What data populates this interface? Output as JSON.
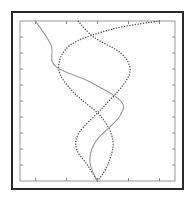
{
  "chart_data": {
    "type": "line",
    "title": "",
    "xlabel": "",
    "ylabel": "",
    "xlim": [
      -1,
      1
    ],
    "ylim": [
      0,
      1
    ],
    "grid": false,
    "legend": "none",
    "x_ticks": [
      -0.8,
      -0.4,
      0.0,
      0.4,
      0.8
    ],
    "y_ticks": [
      0.1,
      0.2,
      0.3,
      0.4,
      0.5,
      0.6,
      0.7,
      0.8,
      0.9
    ],
    "tick_labels_visible": false,
    "series": [
      {
        "name": "curve-1",
        "style": "dotted",
        "color": "#555555",
        "points": [
          [
            0.0,
            0.0
          ],
          [
            -0.13,
            0.1
          ],
          [
            -0.27,
            0.2
          ],
          [
            -0.24,
            0.3
          ],
          [
            0.05,
            0.45
          ],
          [
            0.33,
            0.6
          ],
          [
            0.42,
            0.7
          ],
          [
            0.3,
            0.8
          ],
          [
            -0.05,
            0.9
          ],
          [
            -0.25,
            1.0
          ]
        ]
      },
      {
        "name": "curve-2",
        "style": "dotted",
        "color": "#555555",
        "points": [
          [
            0.0,
            0.0
          ],
          [
            0.13,
            0.1
          ],
          [
            0.2,
            0.25
          ],
          [
            0.05,
            0.4
          ],
          [
            -0.3,
            0.55
          ],
          [
            -0.5,
            0.7
          ],
          [
            -0.35,
            0.85
          ],
          [
            0.2,
            0.95
          ],
          [
            0.8,
            1.0
          ]
        ]
      },
      {
        "name": "curve-3",
        "style": "solid-light",
        "color": "#9a9a9a",
        "points": [
          [
            0.0,
            0.0
          ],
          [
            -0.1,
            0.12
          ],
          [
            -0.02,
            0.25
          ],
          [
            0.28,
            0.4
          ],
          [
            0.3,
            0.5
          ],
          [
            -0.1,
            0.62
          ],
          [
            -0.55,
            0.72
          ],
          [
            -0.6,
            0.85
          ],
          [
            -0.8,
            1.0
          ]
        ]
      }
    ]
  }
}
